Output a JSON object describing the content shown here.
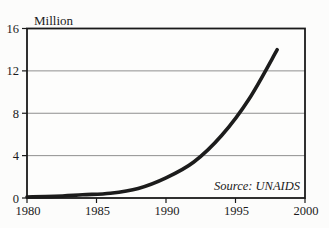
{
  "chart_data": {
    "type": "line",
    "title": "",
    "ylabel": "Million",
    "xlabel": "",
    "source": "Source: UNAIDS",
    "x": [
      1980,
      1982,
      1984,
      1986,
      1988,
      1990,
      1992,
      1994,
      1996,
      1998
    ],
    "series": [
      {
        "name": "million",
        "values": [
          0.1,
          0.15,
          0.3,
          0.45,
          0.9,
          1.9,
          3.4,
          5.9,
          9.4,
          14.0
        ]
      }
    ],
    "xlim": [
      1980,
      2000
    ],
    "ylim": [
      0,
      16
    ],
    "xticks": [
      1980,
      1985,
      1990,
      1995,
      2000
    ],
    "yticks": [
      0,
      4,
      8,
      12,
      16
    ],
    "grid": "horizontal",
    "legend": "none",
    "colors": {
      "background": "#fcfcfb",
      "plot_background": "#fdfdfc",
      "line": "#1c1c1c",
      "gridline": "#8f8f8f",
      "axis_border": "#1a1a1a",
      "text": "#1b1b1b"
    }
  }
}
